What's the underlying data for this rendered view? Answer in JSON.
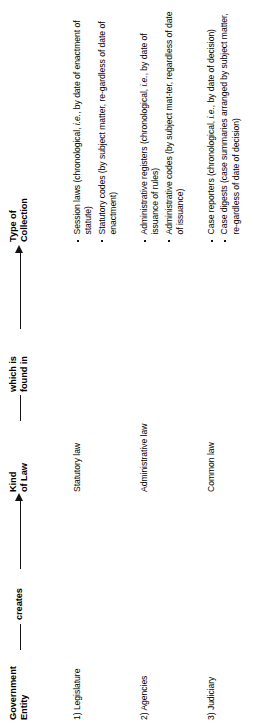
{
  "figure": {
    "title": "Government Entity creates Kind of Law which is found in Type of Collection",
    "columns": [
      {
        "id": "government-entity",
        "header": "Government\nEntity"
      },
      {
        "id": "kind-of-law",
        "header": "Kind\nof Law"
      },
      {
        "id": "type-of-collection",
        "header": "Type of\nCollection"
      }
    ],
    "connectors": [
      {
        "id": "creates",
        "label": "creates"
      },
      {
        "id": "found-in",
        "label": "which is\nfound in"
      }
    ],
    "rows": [
      {
        "entity": "1) Legislature",
        "kind": "Statutory law",
        "collection": [
          "Session laws (chronological, <em>i.e.</em>, by date of enactment of statute)",
          "Statutory codes (by subject matter, re&#8209;gardless of date of enactment)"
        ]
      },
      {
        "entity": "2) Agencies",
        "kind": "Administrative law",
        "collection": [
          "Administrative registers (chronological, <em>i.e.</em>, by date of issuance of rules)",
          "Administrative codes (by subject mat&#8209;ter, regardless of date of issuance)"
        ]
      },
      {
        "entity": "3) Judiciary",
        "kind": "Common law",
        "collection": [
          "Case reporters (chronological, <em>i.e.</em>, by date of decision)",
          "Case digests (case summaries arranged by subject matter, re&#8209;gardless of date of decision)"
        ]
      }
    ],
    "colors": {
      "ink": "#111111",
      "page": "#ffffff"
    }
  }
}
